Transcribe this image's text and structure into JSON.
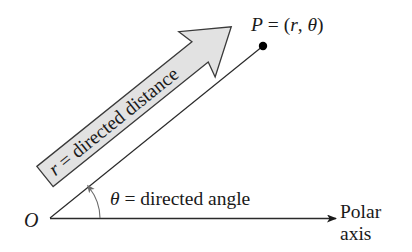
{
  "diagram": {
    "origin_label": "O",
    "point_label": "P = (r, θ)",
    "point_label_parts": {
      "name": "P",
      "eq": " = (",
      "r": "r",
      "comma": ", ",
      "theta": "θ",
      "close": ")"
    },
    "distance_label": "r = directed distance",
    "distance_label_parts": {
      "r": "r",
      "rest": " = directed distance"
    },
    "angle_label": "θ = directed angle",
    "angle_label_parts": {
      "theta": "θ",
      "rest": " = directed angle"
    },
    "axis_label_line1": "Polar",
    "axis_label_line2": "axis",
    "colors": {
      "line": "#2a2a2a",
      "arrow_fill": "#e2e2e2",
      "arrow_stroke": "#3a3a3a",
      "arc": "#6a6a6a",
      "point": "#000000"
    },
    "geometry": {
      "origin": [
        50,
        218
      ],
      "point": [
        263,
        46
      ],
      "axis_end": [
        336,
        219
      ],
      "ray_angle_deg": -38.9
    }
  }
}
